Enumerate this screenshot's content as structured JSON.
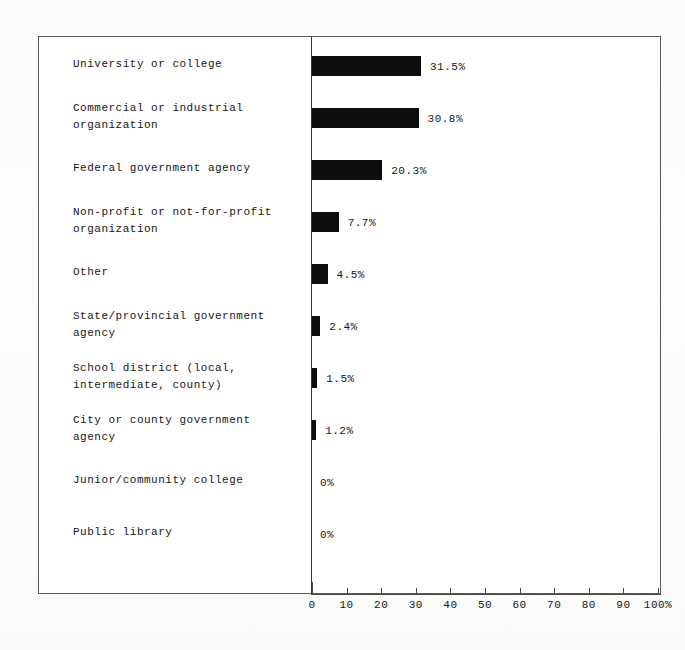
{
  "chart_data": {
    "type": "bar",
    "orientation": "horizontal",
    "title": "",
    "xlabel": "",
    "ylabel": "",
    "xlim": [
      0,
      100
    ],
    "grid": false,
    "legend": false,
    "axis_suffix": "%",
    "tick_labels": [
      "0",
      "10",
      "20",
      "30",
      "40",
      "50",
      "60",
      "70",
      "80",
      "90",
      "100%"
    ],
    "tick_values": [
      0,
      10,
      20,
      30,
      40,
      50,
      60,
      70,
      80,
      90,
      100
    ],
    "categories": [
      "University or college",
      "Commercial or industrial\norganization",
      "Federal government agency",
      "Non-profit or not-for-profit\norganization",
      "Other",
      "State/provincial government\nagency",
      "School district (local,\nintermediate, county)",
      "City or county government\nagency",
      "Junior/community college",
      "Public library"
    ],
    "values": [
      31.5,
      30.8,
      20.3,
      7.7,
      4.5,
      2.4,
      1.5,
      1.2,
      0,
      0
    ],
    "value_labels": [
      "31.5%",
      "30.8%",
      "20.3%",
      "7.7%",
      "4.5%",
      "2.4%",
      "1.5%",
      "1.2%",
      "0%",
      "0%"
    ],
    "bar_color": "#0d0d0d",
    "background_color": "#ffffff"
  }
}
